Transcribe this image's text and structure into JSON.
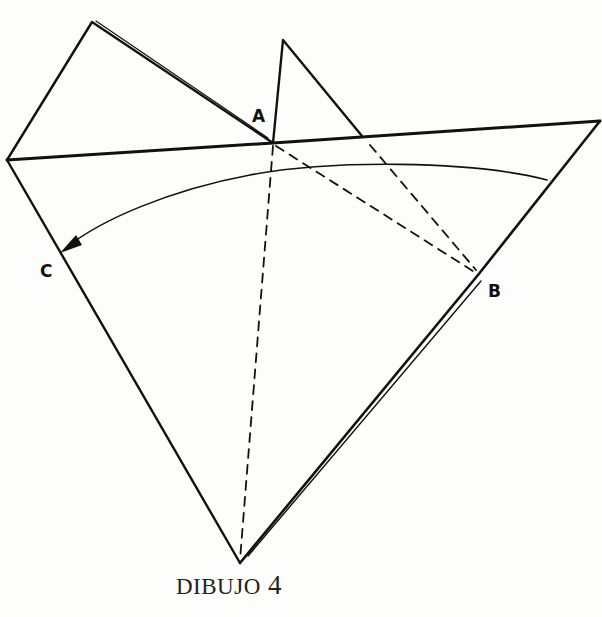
{
  "diagram": {
    "type": "origami-fold-diagram",
    "caption": {
      "word": "DIBUJO",
      "number": "4"
    },
    "labels": {
      "a": "A",
      "b": "B",
      "c": "C"
    },
    "colors": {
      "ink": "#111111",
      "background": "#fdfdfc"
    },
    "instruction": "Fold along dashed line A–B, bringing the right side over toward C (arrow)"
  }
}
